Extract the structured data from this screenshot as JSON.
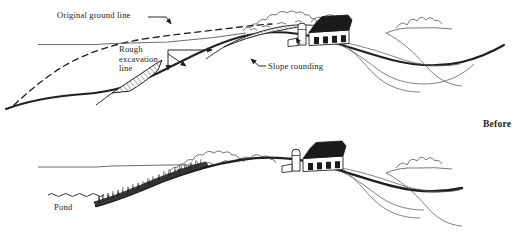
{
  "figure": {
    "title_label": "Before",
    "panels": [
      {
        "name": "top-panel-with-excavation",
        "annotations": [
          {
            "key": "original_ground_line",
            "text": "Original ground line"
          },
          {
            "key": "rough_excavation_line",
            "text": "Rough\nexcavation\nline"
          },
          {
            "key": "slope_rounding",
            "text": "Slope rounding"
          }
        ],
        "features": [
          "dashed original ground profile",
          "hatched cut wedges",
          "barn",
          "silo",
          "treeline",
          "contour field lines"
        ]
      },
      {
        "name": "bottom-panel-with-pond",
        "annotations": [
          {
            "key": "pond",
            "text": "Pond"
          }
        ],
        "features": [
          "pond water line",
          "grassed bank",
          "barn",
          "silo",
          "treeline",
          "contour field lines"
        ]
      }
    ]
  },
  "labels": {
    "original_ground_line": "Original ground line",
    "rough_excavation_line_1": "Rough",
    "rough_excavation_line_2": "excavation",
    "rough_excavation_line_3": "line",
    "slope_rounding": "Slope rounding",
    "pond": "Pond",
    "before": "Before"
  },
  "colors": {
    "ink": "#231f20",
    "thin_line": "#555555",
    "mid_line": "#3a3a3a",
    "background": "#ffffff",
    "roof_fill": "#1a1a1a"
  }
}
